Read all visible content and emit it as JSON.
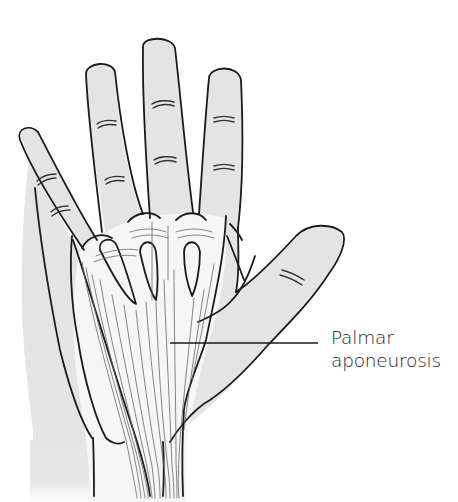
{
  "figure": {
    "colors": {
      "skin_fill": "#e4e4e4",
      "outline": "#1a1a1a",
      "aponeurosis_fill": "#f7f7f7",
      "fiber_lines": "#555555",
      "background": "#ffffff"
    }
  },
  "annotations": [
    {
      "id": "palmar-aponeurosis",
      "lines": [
        "Palmar",
        "aponeurosis"
      ],
      "leader_from": [
        170,
        343
      ],
      "leader_to": [
        318,
        343
      ]
    }
  ]
}
